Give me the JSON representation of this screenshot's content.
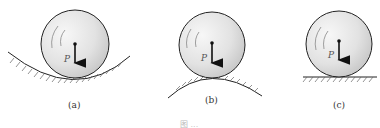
{
  "figure": {
    "caption": "图 ...",
    "panels": [
      {
        "id": "a",
        "label": "(a)",
        "force_label": "P",
        "surface": "concave"
      },
      {
        "id": "b",
        "label": "(b)",
        "force_label": "P",
        "surface": "convex"
      },
      {
        "id": "c",
        "label": "(c)",
        "force_label": "P",
        "surface": "flat"
      }
    ]
  },
  "colors": {
    "sphere_fill_light": "#f4f4f4",
    "sphere_fill_dark": "#c8c8c8",
    "outline": "#222222",
    "hatch": "#555555"
  }
}
